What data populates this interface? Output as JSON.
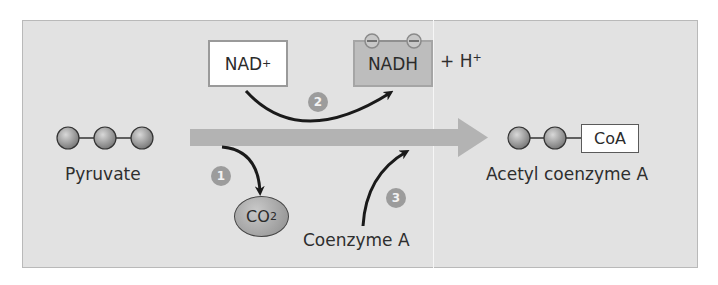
{
  "figure": {
    "nad_box": {
      "text": "NAD",
      "superscript": "+"
    },
    "nadh_box": {
      "text": "NADH"
    },
    "proton": {
      "text": "+ H",
      "superscript": "+"
    },
    "pyruvate": {
      "label": "Pyruvate",
      "carbons": 3
    },
    "acetyl_coa": {
      "label": "Acetyl coenzyme A",
      "carbons": 2,
      "coa_box": "CoA"
    },
    "co2": {
      "text": "CO",
      "subscript": "2"
    },
    "coenzyme_a": {
      "label": "Coenzyme A"
    },
    "steps": [
      {
        "number": "1",
        "description": "CO2 released"
      },
      {
        "number": "2",
        "description": "NAD+ reduced to NADH"
      },
      {
        "number": "3",
        "description": "Coenzyme A attached"
      }
    ],
    "colors": {
      "panel_bg": "#e2e2e2",
      "main_arrow": "#b3b3b3",
      "badge": "#9c9c9c",
      "nadh_fill": "#bdbdbd",
      "curved_arrows": "#1a1a1a"
    }
  }
}
